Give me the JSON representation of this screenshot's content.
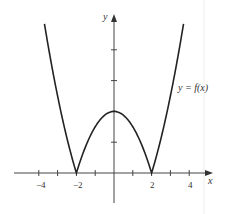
{
  "chart_data": {
    "type": "line",
    "title": "",
    "function_label": "y = f(x)",
    "function": "|x^2 - 4|",
    "xlabel": "x",
    "ylabel": "y",
    "xlim": [
      -5,
      5
    ],
    "ylim": [
      -2,
      10
    ],
    "x_ticks": [
      -4,
      -3,
      -2,
      -1,
      1,
      2,
      3,
      4
    ],
    "x_tick_labels": [
      "-4",
      "-2",
      "2",
      "4"
    ],
    "y_ticks": [
      2,
      4,
      6,
      8
    ],
    "y_tick_labels": [],
    "grid": false,
    "series": [
      {
        "name": "y = f(x)",
        "x": [
          -3.7,
          -3.5,
          -3,
          -2.5,
          -2,
          -1.5,
          -1,
          -0.5,
          0,
          0.5,
          1,
          1.5,
          2,
          2.5,
          3,
          3.5,
          3.7
        ],
        "y": [
          9.69,
          8.25,
          5,
          2.25,
          0,
          1.75,
          3,
          3.75,
          4,
          3.75,
          3,
          1.75,
          0,
          2.25,
          5,
          8.25,
          9.69
        ]
      }
    ],
    "key_points": [
      {
        "x": -2,
        "y": 0
      },
      {
        "x": 0,
        "y": 4
      },
      {
        "x": 2,
        "y": 0
      }
    ]
  },
  "labels": {
    "x_axis": "x",
    "y_axis": "y",
    "curve": "y = f(x)",
    "tick_neg4": "−4",
    "tick_neg2": "−2",
    "tick_2": "2",
    "tick_4": "4"
  }
}
